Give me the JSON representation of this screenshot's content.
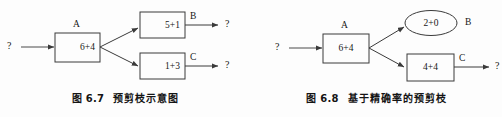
{
  "page": {
    "background_color": "#fdfdfd",
    "line_color": "#404040",
    "text_color": "#171717"
  },
  "figures": [
    {
      "id": "figure-6-7",
      "caption_number": "图 6.7",
      "caption_text": "预剪枝示意图",
      "input_marker": "?",
      "nodes": [
        {
          "name": "root",
          "shape": "rect",
          "value": "6+4",
          "label": "A"
        },
        {
          "name": "branch-top",
          "shape": "rect",
          "value": "5+1",
          "label": "B"
        },
        {
          "name": "branch-bot",
          "shape": "rect",
          "value": "1+3",
          "label": "C"
        }
      ],
      "outputs": [
        {
          "name": "output-top",
          "marker": "?"
        },
        {
          "name": "output-bot",
          "marker": "?"
        }
      ]
    },
    {
      "id": "figure-6-8",
      "caption_number": "图 6.8",
      "caption_text": "基于精确率的预剪枝",
      "input_marker": "?",
      "nodes": [
        {
          "name": "root",
          "shape": "rect",
          "value": "6+4",
          "label": "A"
        },
        {
          "name": "branch-top",
          "shape": "ellipse",
          "value": "2+0",
          "label": "B"
        },
        {
          "name": "branch-bot",
          "shape": "rect",
          "value": "4+4",
          "label": "C"
        }
      ],
      "outputs": [
        {
          "name": "output-bot",
          "marker": "?"
        }
      ]
    }
  ]
}
